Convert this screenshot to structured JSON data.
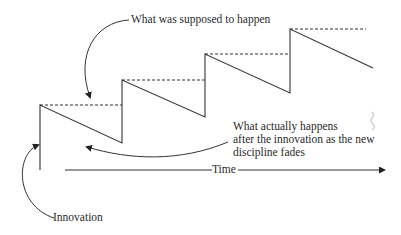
{
  "diagram": {
    "labels": {
      "supposed": "What was supposed to happen",
      "actual_line1": "What actually happens",
      "actual_line2": "after the innovation as the new",
      "actual_line3": "discipline fades",
      "time": "Time",
      "innovation": "Innovation"
    },
    "colors": {
      "line": "#333333",
      "background": "#ffffff"
    },
    "sawtooth_points": [
      [
        40,
        170
      ],
      [
        40,
        105
      ],
      [
        122,
        143
      ],
      [
        122,
        80
      ],
      [
        205,
        117
      ],
      [
        205,
        54
      ],
      [
        290,
        93
      ],
      [
        290,
        29
      ],
      [
        373,
        68
      ]
    ],
    "dashed_levels": [
      [
        40,
        105,
        122
      ],
      [
        122,
        80,
        205
      ],
      [
        205,
        54,
        290
      ],
      [
        290,
        29,
        366
      ]
    ]
  }
}
